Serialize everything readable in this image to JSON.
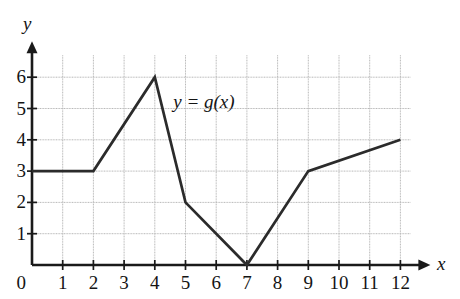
{
  "chart_data": {
    "type": "line",
    "title": "",
    "subtitle": "",
    "xlabel": "x",
    "ylabel": "y",
    "curve_label": "y = g(x)",
    "xlim": [
      0,
      12
    ],
    "ylim": [
      0,
      6
    ],
    "xticks": [
      0,
      1,
      2,
      3,
      4,
      5,
      6,
      7,
      8,
      9,
      10,
      11,
      12
    ],
    "yticks": [
      1,
      2,
      3,
      4,
      5,
      6
    ],
    "xtick_labels": [
      "0",
      "1",
      "2",
      "3",
      "4",
      "5",
      "6",
      "7",
      "8",
      "9",
      "10",
      "11",
      "12"
    ],
    "ytick_labels": [
      "1",
      "2",
      "3",
      "4",
      "5",
      "6"
    ],
    "origin_label": "0",
    "grid": true,
    "grid_color": "#b9b9b9",
    "axis_color": "#1a1a1a",
    "curve_color": "#2b2b2b",
    "legend": null,
    "legend_position": "none",
    "series": [
      {
        "name": "g",
        "points": [
          {
            "x": 0,
            "y": 3
          },
          {
            "x": 2,
            "y": 3
          },
          {
            "x": 4,
            "y": 6
          },
          {
            "x": 5,
            "y": 2
          },
          {
            "x": 7,
            "y": 0
          },
          {
            "x": 9,
            "y": 3
          },
          {
            "x": 12,
            "y": 4
          }
        ]
      }
    ],
    "annotations": [
      {
        "text": "y = g(x)",
        "x": 4.6,
        "y": 5.2
      }
    ]
  },
  "axes": {
    "y_axis_name": "y",
    "x_axis_name": "x"
  }
}
